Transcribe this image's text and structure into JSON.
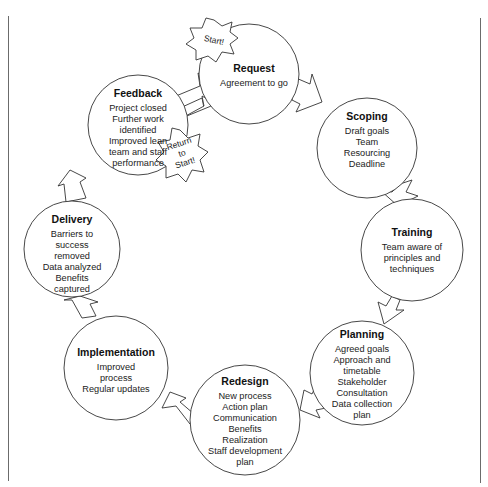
{
  "diagram": {
    "type": "cycle",
    "colors": {
      "stroke": "#333333",
      "fill": "#ffffff",
      "frame": "#6b6b6b"
    },
    "start_badge": {
      "label": "Start!"
    },
    "return_badge": {
      "lines": [
        "Return",
        "to",
        "Start!"
      ]
    },
    "nodes": [
      {
        "id": "request",
        "title": "Request",
        "lines": [
          "Agreement to go"
        ]
      },
      {
        "id": "scoping",
        "title": "Scoping",
        "lines": [
          "Draft goals",
          "Team",
          "Resourcing",
          "Deadline"
        ]
      },
      {
        "id": "training",
        "title": "Training",
        "lines": [
          "Team aware of",
          "principles and",
          "techniques"
        ]
      },
      {
        "id": "planning",
        "title": "Planning",
        "lines": [
          "Agreed goals",
          "Approach and",
          "timetable",
          "Stakeholder",
          "Consultation",
          "Data collection",
          "plan"
        ]
      },
      {
        "id": "redesign",
        "title": "Redesign",
        "lines": [
          "New process",
          "Action plan",
          "Communication",
          "Benefits",
          "Realization",
          "Staff development",
          "plan"
        ]
      },
      {
        "id": "implementation",
        "title": "Implementation",
        "lines": [
          "Improved",
          "process",
          "Regular updates"
        ]
      },
      {
        "id": "delivery",
        "title": "Delivery",
        "lines": [
          "Barriers to",
          "success",
          "removed",
          "Data analyzed",
          "Benefits",
          "captured"
        ]
      },
      {
        "id": "feedback",
        "title": "Feedback",
        "lines": [
          "Project closed",
          "Further work",
          "identified",
          "Improved lean",
          "team and staff",
          "performance"
        ]
      }
    ]
  }
}
